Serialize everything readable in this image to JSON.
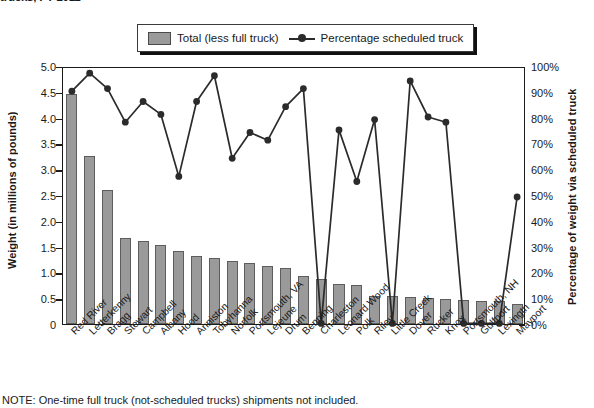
{
  "title": "trucks, FY 2011",
  "note": "NOTE: One-time full truck (not-scheduled trucks) shipments not included.",
  "legend": {
    "bar_label": "Total (less full truck)",
    "line_label": "Percentage scheduled truck",
    "bar_color": "#9a9a9a",
    "line_color": "#2b2b2b"
  },
  "axes": {
    "left_title": "Weight (in millions of pounds)",
    "right_title": "Percentage of weight via scheduled truck",
    "left_ticks": [
      "5.0",
      "4.5",
      "4.0",
      "3.5",
      "3.0",
      "2.5",
      "2.0",
      "1.5",
      "1.0",
      "0.5",
      "0"
    ],
    "right_ticks": [
      "100%",
      "90%",
      "80%",
      "70%",
      "60%",
      "50%",
      "40%",
      "30%",
      "20%",
      "10%",
      "0%"
    ]
  },
  "chart_data": {
    "type": "bar",
    "title": "trucks, FY 2011",
    "xlabel": "",
    "ylabel": "Weight (in millions of pounds)",
    "y2label": "Percentage of weight via scheduled truck",
    "ylim": [
      0,
      5.0
    ],
    "y2lim": [
      0,
      100
    ],
    "grid": false,
    "legend_position": "top-center",
    "categories": [
      "Red River",
      "Letterkenny",
      "Bragg",
      "Stewart",
      "Campbell",
      "Albany",
      "Hood",
      "Anniston",
      "Tobyhanna",
      "Norfolk",
      "Portsmouth, VA",
      "Lejeune",
      "Drum",
      "Benning",
      "Charleston",
      "Leonard Wood",
      "Polk",
      "Riley",
      "Little Creek",
      "Dover",
      "Rucker",
      "Knox",
      "Portsmouth, NH",
      "Gulfport",
      "Lexingtn",
      "Mayport"
    ],
    "series": [
      {
        "name": "Total (less full truck)",
        "type": "bar",
        "axis": "left",
        "unit": "millions of pounds",
        "values": [
          4.45,
          3.25,
          2.59,
          1.66,
          1.6,
          1.54,
          1.41,
          1.32,
          1.28,
          1.22,
          1.18,
          1.13,
          1.08,
          0.93,
          0.88,
          0.77,
          0.76,
          0.55,
          0.54,
          0.53,
          0.5,
          0.48,
          0.46,
          0.44,
          0.45,
          0.39
        ]
      },
      {
        "name": "Percentage scheduled truck",
        "type": "line",
        "axis": "right",
        "unit": "percent",
        "values": [
          91,
          98,
          92,
          79,
          87,
          82,
          58,
          87,
          97,
          65,
          75,
          72,
          85,
          92,
          1,
          76,
          56,
          80,
          1,
          95,
          81,
          79,
          1,
          1,
          1,
          50
        ]
      }
    ]
  }
}
